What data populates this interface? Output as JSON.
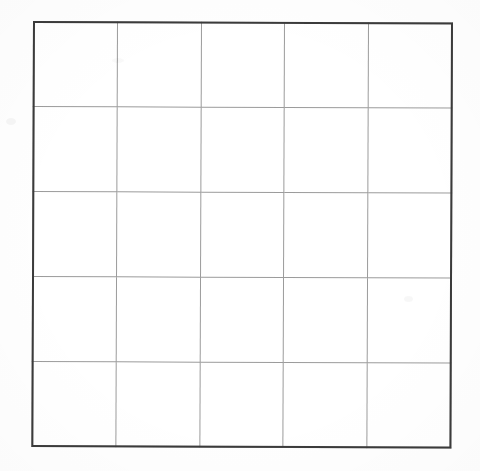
{
  "document": {
    "type": "scanned-grid-table",
    "title": "Empty grid table",
    "background_color": "#fefefe",
    "canvas": {
      "width": 480,
      "height": 471
    }
  },
  "table": {
    "name": "empty-grid-table",
    "rows": 5,
    "columns": 5,
    "total_cells": 25,
    "has_header_row": false,
    "is_empty": true,
    "outer_border_color": "#3b3b3b",
    "outer_border_width_px": 2,
    "grid_line_color": "#9b9b9b",
    "grid_line_width_px": 1,
    "cell_fill_color": "#ffffff",
    "bounds": {
      "left": 33,
      "top": 21,
      "right": 453,
      "bottom": 447
    },
    "column_edges_px": [
      33,
      117,
      201,
      286,
      371,
      453
    ],
    "row_edges_px": [
      21,
      104,
      190,
      275,
      360,
      447
    ],
    "cells": [
      [
        "",
        "",
        "",
        "",
        ""
      ],
      [
        "",
        "",
        "",
        "",
        ""
      ],
      [
        "",
        "",
        "",
        "",
        ""
      ],
      [
        "",
        "",
        "",
        "",
        ""
      ],
      [
        "",
        "",
        "",
        "",
        ""
      ]
    ]
  },
  "artifacts": {
    "skew_degrees": 0.22,
    "smudges": [
      "left-margin-smudge",
      "right-margin-smudge",
      "top-margin-smudge"
    ]
  }
}
